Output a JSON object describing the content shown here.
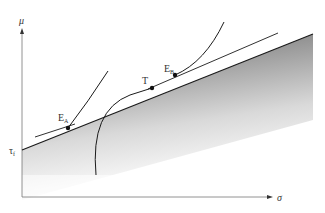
{
  "axes": {
    "y_label": "μ",
    "x_label": "σ",
    "y_intercept_label": "τ",
    "y_intercept_sub": "f"
  },
  "points": {
    "EA": {
      "label": "E",
      "sub": "A"
    },
    "EB": {
      "label": "E",
      "sub": "B"
    },
    "T": {
      "label": "T"
    }
  },
  "colors": {
    "line": "#1a1a1a",
    "axis": "#555555",
    "shade_dark": "#8c8c8c",
    "shade_light": "#ffffff"
  }
}
